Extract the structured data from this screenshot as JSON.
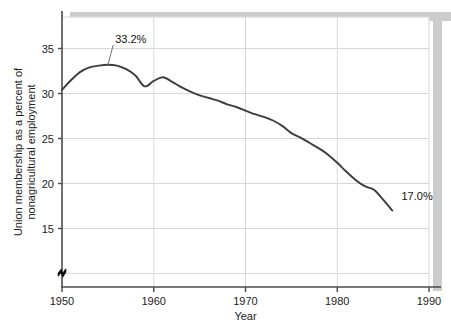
{
  "chart_data": {
    "type": "line",
    "title": "",
    "xlabel": "Year",
    "ylabel": "Union membership as a percent of nonagricultural employment",
    "xlim": [
      1950,
      1990
    ],
    "ylim": [
      8.5,
      38.5
    ],
    "grid": true,
    "legend": "none",
    "axis_break": "y-axis break symbol near origin",
    "xticks": [
      "1950",
      "1960",
      "1970",
      "1980",
      "1990"
    ],
    "xtick_values": [
      1950,
      1960,
      1970,
      1980,
      1990
    ],
    "yticks": [
      "35",
      "30",
      "25",
      "20",
      "15"
    ],
    "ytick_values": [
      35,
      30,
      25,
      20,
      15
    ],
    "gridline_values": [
      35,
      30,
      25,
      20,
      15,
      10
    ],
    "series": [
      {
        "name": "Union membership as a percent of nonagricultural employment",
        "color": "#3d3d3d",
        "x": [
          1950,
          1951,
          1952,
          1953,
          1954,
          1955,
          1956,
          1957,
          1958,
          1959,
          1960,
          1961,
          1962,
          1963,
          1964,
          1965,
          1966,
          1967,
          1968,
          1969,
          1970,
          1971,
          1972,
          1973,
          1974,
          1975,
          1976,
          1977,
          1978,
          1979,
          1980,
          1981,
          1982,
          1983,
          1984,
          1985,
          1986
        ],
        "y": [
          30.4,
          31.5,
          32.4,
          32.9,
          33.1,
          33.2,
          33.1,
          32.7,
          32.0,
          30.8,
          31.4,
          31.8,
          31.3,
          30.7,
          30.2,
          29.8,
          29.5,
          29.2,
          28.8,
          28.5,
          28.1,
          27.7,
          27.4,
          27.0,
          26.4,
          25.6,
          25.1,
          24.5,
          23.9,
          23.2,
          22.3,
          21.3,
          20.4,
          19.7,
          19.3,
          18.2,
          17.0
        ]
      }
    ],
    "annotations": [
      {
        "label": "33.2%",
        "x": 1955,
        "y": 33.2,
        "text_x": 1955.8,
        "text_y": 35.6,
        "leader": true
      },
      {
        "label": "17.0%",
        "x": 1986,
        "y": 17.0,
        "text_x": 1987.0,
        "text_y": 18.2,
        "leader": false
      }
    ]
  },
  "colors": {
    "line": "#3d3d3d",
    "grid": "#d8d8d8",
    "axis": "#4a4a4a",
    "shadow": "#cccccc",
    "background": "#ffffff",
    "text": "#1a1a1a"
  }
}
